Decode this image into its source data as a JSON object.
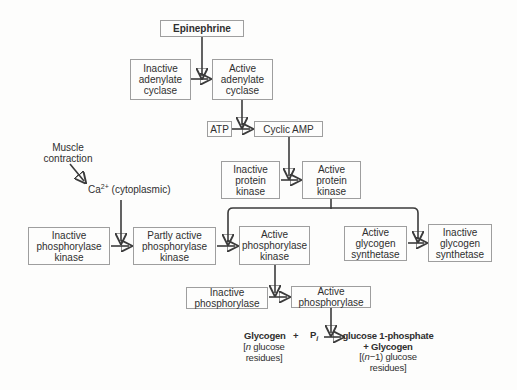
{
  "nodes": {
    "epinephrine": "Epinephrine",
    "inactive_adenylate_cyclase": "Inactive adenylate cyclase",
    "active_adenylate_cyclase": "Active adenylate cyclase",
    "atp": "ATP",
    "cyclic_amp": "Cyclic AMP",
    "inactive_protein_kinase": "Inactive protein kinase",
    "active_protein_kinase": "Active protein kinase",
    "inactive_phosphorylase_kinase": "Inactive phosphorylase kinase",
    "partly_active_phosphorylase_kinase": "Partly active phosphorylase kinase",
    "active_phosphorylase_kinase": "Active phosphorylase kinase",
    "active_glycogen_synthetase": "Active glycogen synthetase",
    "inactive_glycogen_synthetase": "Inactive glycogen synthetase",
    "inactive_phosphorylase": "Inactive phosphorylase",
    "active_phosphorylase": "Active phosphorylase"
  },
  "annotations": {
    "muscle_contraction": "Muscle contraction",
    "calcium": {
      "base": "Ca",
      "sup": "2+",
      "rest": " (cytoplasmic)"
    }
  },
  "reaction": {
    "substrate": "Glycogen",
    "plus": "+",
    "phosphate_base": "P",
    "phosphate_sub": "i",
    "substrate_note": {
      "bracket": "[",
      "var": "n",
      "after": " glucose",
      "line2": "residues]"
    },
    "product_line1": "glucose 1-phosphate",
    "product_line2": "+ Glycogen",
    "product_note": {
      "bracket": "[(",
      "var": "n",
      "after": "−1) glucose",
      "line2": "residues]"
    }
  }
}
